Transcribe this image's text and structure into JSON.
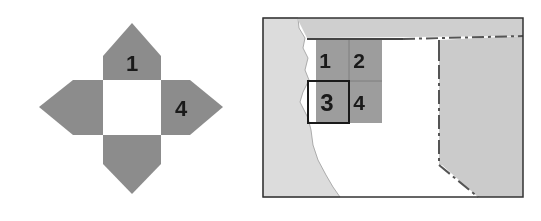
{
  "left_figure": {
    "description": "net of a square pyramid (cross shape with pointed arms)",
    "labels": {
      "top_arm": "1",
      "right_arm": "4"
    },
    "colors": {
      "arm_fill": "#8c8c8c",
      "center_fill": "#ffffff"
    }
  },
  "right_figure": {
    "description": "map with a 2x2 numbered grid of tiles, tile 3 highlighted",
    "tiles": [
      {
        "label": "1"
      },
      {
        "label": "2"
      },
      {
        "label": "3",
        "highlighted": true
      },
      {
        "label": "4"
      }
    ],
    "colors": {
      "land_light": "#dedede",
      "land_mid": "#cdcdcd",
      "tile_fill": "#9a9a9a",
      "frame": "#333333",
      "white": "#ffffff"
    }
  }
}
